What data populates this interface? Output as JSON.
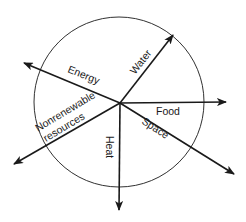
{
  "diagram": {
    "labels": {
      "water": "Water",
      "energy": "Energy",
      "food": "Food",
      "space": "Space",
      "heat": "Heat",
      "nonrenewable_line1": "Nonrenewable",
      "nonrenewable_line2": "resources"
    },
    "colors": {
      "stroke": "#1a1a1a",
      "background": "#ffffff"
    }
  }
}
